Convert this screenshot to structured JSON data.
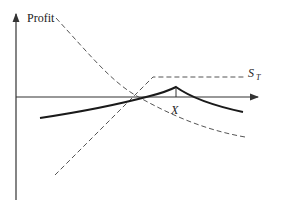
{
  "diagram": {
    "y_axis_label": "Profit",
    "x_axis_label_main": "S",
    "x_axis_label_sub": "T",
    "strike_label": "X",
    "colors": {
      "axis": "#333333",
      "bold_curve": "#1a1a1a",
      "dashed": "#555555",
      "background": "#ffffff"
    },
    "elements": [
      {
        "name": "y-axis",
        "type": "arrow-line"
      },
      {
        "name": "x-axis",
        "type": "arrow-line"
      },
      {
        "name": "dashed-call-payoff",
        "style": "dashed",
        "shape": "rising line then flat"
      },
      {
        "name": "dashed-option-value-curve",
        "style": "dashed",
        "shape": "decreasing convex curve"
      },
      {
        "name": "bold-profit-curve",
        "style": "solid bold",
        "shape": "peak at X"
      },
      {
        "name": "strike-tick",
        "position": "X"
      }
    ]
  }
}
